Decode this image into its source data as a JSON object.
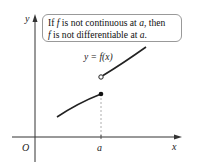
{
  "callout": {
    "line1_a": "If ",
    "line1_f": "f",
    "line1_b": " is not continuous at ",
    "line1_a_var": "a",
    "line1_c": ", then",
    "line2_f": "f",
    "line2_b": " is not differentiable at ",
    "line2_a_var": "a",
    "line2_c": "."
  },
  "axes": {
    "y_label": "y",
    "x_label": "x",
    "origin_label": "O",
    "a_label": "a"
  },
  "curve": {
    "label": "y = f(x)"
  },
  "colors": {
    "axis": "#333333",
    "curve": "#222222",
    "dashed": "#999999",
    "callout_border": "#999999"
  }
}
